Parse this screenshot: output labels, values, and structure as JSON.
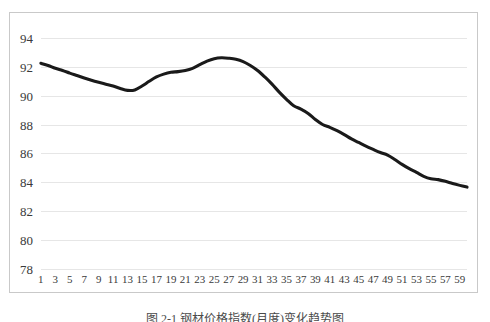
{
  "figure": {
    "caption": "图 2-1  钢材价格指数(月度)变化趋势图",
    "caption_visible_note": "clipped"
  },
  "chart_data": {
    "type": "line",
    "title": "",
    "xlabel": "",
    "ylabel": "",
    "ylim": [
      78,
      94
    ],
    "ytick_step": 2,
    "yticks": [
      94,
      92,
      90,
      88,
      86,
      84,
      82,
      80,
      78
    ],
    "grid": true,
    "grid_axis": "y",
    "legend": false,
    "legend_position": "none",
    "line_color": "#1a1a1a",
    "grid_color": "#e6e6e6",
    "border_color": "#c9c9c9",
    "x": [
      1,
      2,
      3,
      4,
      5,
      6,
      7,
      8,
      9,
      10,
      11,
      12,
      13,
      14,
      15,
      16,
      17,
      18,
      19,
      20,
      21,
      22,
      23,
      24,
      25,
      26,
      27,
      28,
      29,
      30,
      31,
      32,
      33,
      34,
      35,
      36,
      37,
      38,
      39,
      40,
      41,
      42,
      43,
      44,
      45,
      46,
      47,
      48,
      49,
      50,
      51,
      52,
      53,
      54,
      55,
      56,
      57,
      58,
      59,
      60
    ],
    "xticks": [
      1,
      3,
      5,
      7,
      9,
      11,
      13,
      15,
      17,
      19,
      21,
      23,
      25,
      27,
      29,
      31,
      33,
      35,
      37,
      39,
      41,
      43,
      45,
      47,
      49,
      51,
      53,
      55,
      57,
      59
    ],
    "xticklabels": [
      "1",
      "3",
      "5",
      "7",
      "9",
      "11",
      "13",
      "15",
      "17",
      "19",
      "21",
      "23",
      "25",
      "27",
      "29",
      "31",
      "33",
      "35",
      "37",
      "39",
      "41",
      "43",
      "45",
      "47",
      "49",
      "51",
      "53",
      "55",
      "57",
      "59"
    ],
    "values": [
      92.3,
      92.15,
      91.95,
      91.8,
      91.62,
      91.45,
      91.28,
      91.12,
      90.98,
      90.85,
      90.72,
      90.55,
      90.42,
      90.45,
      90.72,
      91.05,
      91.35,
      91.55,
      91.68,
      91.72,
      91.8,
      91.95,
      92.2,
      92.45,
      92.62,
      92.68,
      92.65,
      92.58,
      92.42,
      92.15,
      91.8,
      91.35,
      90.85,
      90.3,
      89.8,
      89.35,
      89.12,
      88.82,
      88.4,
      88.05,
      87.85,
      87.62,
      87.35,
      87.05,
      86.8,
      86.55,
      86.32,
      86.1,
      85.92,
      85.62,
      85.28,
      84.98,
      84.72,
      84.45,
      84.28,
      84.22,
      84.1,
      83.95,
      83.82,
      83.7
    ],
    "series": [
      {
        "name": "series-1",
        "values": [
          92.3,
          92.15,
          91.95,
          91.8,
          91.62,
          91.45,
          91.28,
          91.12,
          90.98,
          90.85,
          90.72,
          90.55,
          90.42,
          90.45,
          90.72,
          91.05,
          91.35,
          91.55,
          91.68,
          91.72,
          91.8,
          91.95,
          92.2,
          92.45,
          92.62,
          92.68,
          92.65,
          92.58,
          92.42,
          92.15,
          91.8,
          91.35,
          90.85,
          90.3,
          89.8,
          89.35,
          89.12,
          88.82,
          88.4,
          88.05,
          87.85,
          87.62,
          87.35,
          87.05,
          86.8,
          86.55,
          86.32,
          86.1,
          85.92,
          85.62,
          85.28,
          84.98,
          84.72,
          84.45,
          84.28,
          84.22,
          84.1,
          83.95,
          83.82,
          83.7
        ]
      }
    ]
  }
}
